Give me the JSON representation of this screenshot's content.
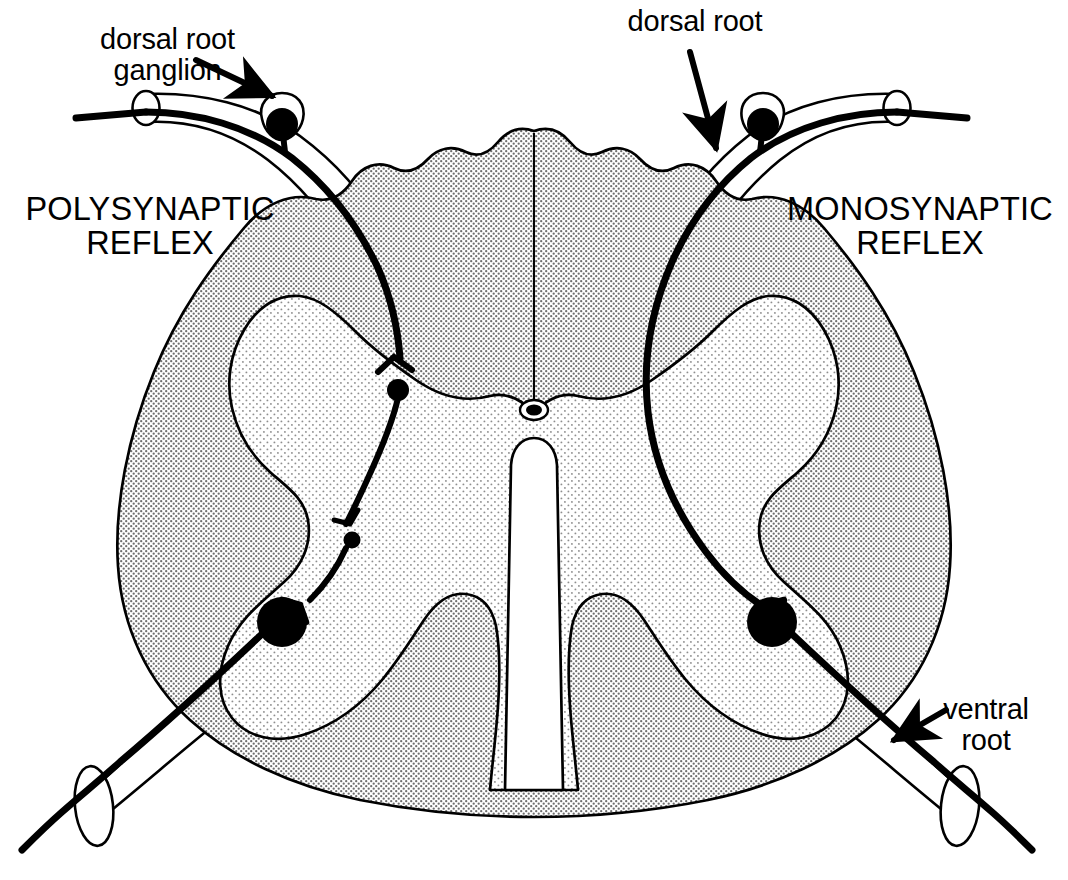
{
  "figure": {
    "background_color": "#ffffff",
    "ink_color": "#000000"
  },
  "labels": {
    "dorsal_root_ganglion": "dorsal root\nganglion",
    "dorsal_root": "dorsal root",
    "ventral_root": "ventral\nroot",
    "polysynaptic_reflex": "POLYSYNAPTIC\nREFLEX",
    "monosynaptic_reflex": "MONOSYNAPTIC\nREFLEX"
  },
  "anatomy": {
    "white_matter": {
      "name": "white matter",
      "fill": "#d9d9d9",
      "stipple": "dense"
    },
    "gray_matter": {
      "name": "gray matter",
      "fill": "#f0f0f0",
      "stipple": "light"
    },
    "central_canal": {
      "name": "central canal",
      "fill": "#000000"
    },
    "ventral_median_fissure": {
      "name": "ventral median fissure",
      "fill": "#ffffff"
    },
    "dorsal_median_septum": {
      "name": "dorsal median septum",
      "stroke": "#000000"
    }
  },
  "neurons": {
    "left_side": {
      "pathway": "polysynaptic",
      "sensory_ganglion_cell": {
        "name": "dorsal-root-ganglion-cell",
        "radius": 16
      },
      "interneurons": [
        {
          "name": "interneuron-upper",
          "radius": 11
        },
        {
          "name": "interneuron-lower",
          "radius": 8
        }
      ],
      "motor_neuron": {
        "name": "motor-neuron-cell-body",
        "radius": 25
      },
      "synapse_count": 3
    },
    "right_side": {
      "pathway": "monosynaptic",
      "sensory_ganglion_cell": {
        "name": "dorsal-root-ganglion-cell",
        "radius": 16
      },
      "interneurons": [],
      "motor_neuron": {
        "name": "motor-neuron-cell-body",
        "radius": 25
      },
      "synapse_count": 1
    }
  }
}
